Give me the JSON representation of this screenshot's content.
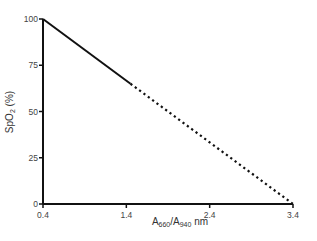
{
  "chart_data": {
    "type": "line",
    "title": "",
    "xlabel": "A660/A940 nm",
    "xlabel_parts": {
      "base1": "A",
      "sub1": "660",
      "mid": "/A",
      "sub2": "940",
      "suffix": " nm"
    },
    "ylabel": "SpO2 (%)",
    "ylabel_parts": {
      "base": "SpO",
      "sub": "2",
      "suffix": " (%)"
    },
    "xlim": [
      0.4,
      3.4
    ],
    "ylim": [
      0,
      100
    ],
    "x_ticks": [
      0.4,
      1.4,
      2.4,
      3.4
    ],
    "x_tick_labels": [
      "0.4",
      "1.4",
      "2.4",
      "3.4"
    ],
    "y_ticks": [
      0,
      25,
      50,
      75,
      100
    ],
    "y_tick_labels": [
      "0",
      "25",
      "50",
      "75",
      "100"
    ],
    "grid": false,
    "legend": null,
    "series": [
      {
        "name": "measured (solid)",
        "style": "solid",
        "x": [
          0.4,
          1.45
        ],
        "y": [
          100,
          65
        ]
      },
      {
        "name": "extrapolated (dotted)",
        "style": "dotted",
        "x": [
          1.45,
          3.4
        ],
        "y": [
          65,
          0
        ]
      }
    ],
    "colors": {
      "line": "#111111",
      "axis": "#111111",
      "text": "#444444"
    }
  }
}
